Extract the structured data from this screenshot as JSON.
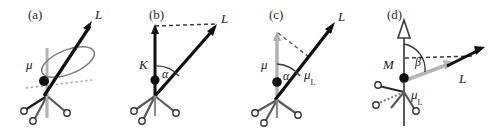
{
  "figure": {
    "type": "scientific-diagram",
    "background_color": "#ffffff",
    "colors": {
      "vector_dark": "#111111",
      "vector_gray": "#a8a8a8",
      "molecule_dark": "#1a1a1a",
      "molecule_gray": "#8d8d8d",
      "dashed_line": "#3a3a3a",
      "label_text": "#1a1a1a"
    }
  },
  "panels": [
    {
      "id": "a",
      "tag": "(a)",
      "labels": {
        "angular_momentum": "L",
        "magnetic_moment": "μ"
      },
      "elements": [
        "precession-ellipse",
        "dotted-horizontal-line",
        "L-arrow",
        "mu-dot-vector",
        "molecule-tripod"
      ]
    },
    {
      "id": "b",
      "tag": "(b)",
      "labels": {
        "angular_momentum": "L",
        "k_vector": "K",
        "angle": "α"
      },
      "elements": [
        "K-arrow-vertical",
        "L-arrow",
        "angle-arc-alpha",
        "dashed-connector",
        "molecule-tripod"
      ]
    },
    {
      "id": "c",
      "tag": "(c)",
      "labels": {
        "angular_momentum": "L",
        "magnetic_moment": "μ",
        "angle": "α",
        "projected_moment": "μ",
        "projected_moment_sub": "L"
      },
      "elements": [
        "mu-arrow-gray-vertical",
        "L-arrow",
        "angle-arc-alpha",
        "dashed-connector",
        "molecule-tripod"
      ]
    },
    {
      "id": "d",
      "tag": "(d)",
      "labels": {
        "angular_momentum": "L",
        "m_vector": "M",
        "angle": "β",
        "projected_moment": "μ",
        "projected_moment_sub": "L"
      },
      "elements": [
        "M-hollow-arrow-vertical",
        "mu-L-gray-arrow",
        "L-arrow",
        "angle-arc-beta",
        "dashed-connector",
        "molecule-tripod"
      ]
    }
  ]
}
